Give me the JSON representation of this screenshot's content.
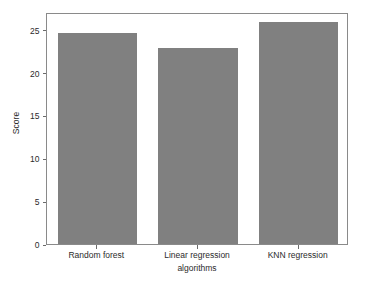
{
  "chart_data": {
    "type": "bar",
    "title": "",
    "subtitle": "",
    "categories": [
      "Random forest",
      "Linear regression",
      "KNN regression"
    ],
    "values": [
      24.7,
      22.9,
      25.9
    ],
    "series": [
      {
        "name": "Score",
        "values": [
          24.7,
          22.9,
          25.9
        ]
      }
    ],
    "xlabel": "algorithms",
    "ylabel": "Score",
    "ylim": [
      0,
      27.1
    ],
    "yticks": [
      0,
      5,
      10,
      15,
      20,
      25
    ],
    "ytick_labels": [
      "0",
      "5",
      "10",
      "15",
      "20",
      "25"
    ],
    "grid": false,
    "legend": false,
    "legend_position": "none",
    "bar_color": "#808080",
    "frame_color": "#8a8a8a",
    "text_color": "#2b2b2b",
    "background": "#ffffff",
    "annotations": []
  }
}
